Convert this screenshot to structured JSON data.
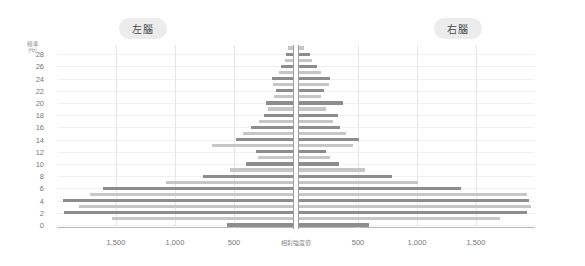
{
  "panels": {
    "left": {
      "badge": "左腦"
    },
    "right": {
      "badge": "右腦"
    }
  },
  "axes": {
    "y_label_main": "頻率",
    "y_label_unit": "(Hz)",
    "x_axis_title": "相對強度值",
    "y_ticks": [
      0,
      2,
      4,
      6,
      8,
      10,
      12,
      14,
      16,
      18,
      20,
      22,
      24,
      26,
      28
    ],
    "y_min": 0,
    "y_max": 29,
    "x_ticks_left": [
      "1,500",
      "1,000",
      "500"
    ],
    "x_ticks_right": [
      "500",
      "1,000",
      "1,500"
    ],
    "x_max": 2000,
    "grid": true
  },
  "colors": {
    "bar_dark": "#8d8d8d",
    "bar_light": "#c6c6c6",
    "badge_bg": "#ececec",
    "badge_text": "#4a4a4a",
    "grid": "#e6e6e6",
    "axis": "#9e9e9e",
    "tick_text": "#777777"
  },
  "chart_data": {
    "type": "bar",
    "orientation": "horizontal-diverging",
    "xlabel": "相對強度值",
    "ylabel": "頻率 (Hz)",
    "xlim": [
      2000,
      2000
    ],
    "ylim": [
      0,
      29
    ],
    "grid": true,
    "legend": null,
    "categories": [
      0,
      1,
      2,
      3,
      4,
      5,
      6,
      7,
      8,
      9,
      10,
      11,
      12,
      13,
      14,
      15,
      16,
      17,
      18,
      19,
      20,
      21,
      22,
      23,
      24,
      25,
      26,
      27,
      28,
      29
    ],
    "series": [
      {
        "name": "左腦",
        "direction": "left",
        "values": [
          560,
          1530,
          1940,
          1810,
          1950,
          1720,
          1610,
          1080,
          760,
          530,
          400,
          300,
          310,
          690,
          480,
          420,
          360,
          290,
          250,
          210,
          230,
          160,
          140,
          170,
          180,
          120,
          100,
          70,
          60,
          40
        ]
      },
      {
        "name": "右腦",
        "direction": "right",
        "values": [
          590,
          1700,
          1930,
          1970,
          1950,
          1930,
          1370,
          1010,
          790,
          560,
          340,
          260,
          230,
          460,
          510,
          400,
          350,
          290,
          330,
          230,
          370,
          190,
          210,
          250,
          260,
          190,
          150,
          110,
          90,
          40
        ]
      }
    ]
  }
}
